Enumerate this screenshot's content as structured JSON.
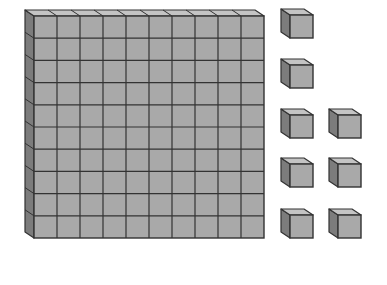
{
  "diagram": {
    "total_value": 108,
    "colors": {
      "front": "#a9a9a9",
      "side": "#7c7c7c",
      "top": "#c4c4c4",
      "outline": "#333333",
      "background": "#ffffff"
    },
    "hundred_flat": {
      "label": "hundreds",
      "value": 100,
      "rows": 10,
      "cols": 10,
      "x": 34,
      "y": 16,
      "width": 230,
      "height": 222,
      "depth_x": 9,
      "depth_y": 6
    },
    "unit_cubes": {
      "label": "ones",
      "count": 8,
      "size": 23,
      "depth_x": 9,
      "depth_y": 6,
      "positions": [
        {
          "x": 290,
          "y": 15
        },
        {
          "x": 290,
          "y": 65
        },
        {
          "x": 290,
          "y": 115
        },
        {
          "x": 338,
          "y": 115
        },
        {
          "x": 290,
          "y": 164
        },
        {
          "x": 338,
          "y": 164
        },
        {
          "x": 290,
          "y": 215
        },
        {
          "x": 338,
          "y": 215
        }
      ]
    }
  }
}
